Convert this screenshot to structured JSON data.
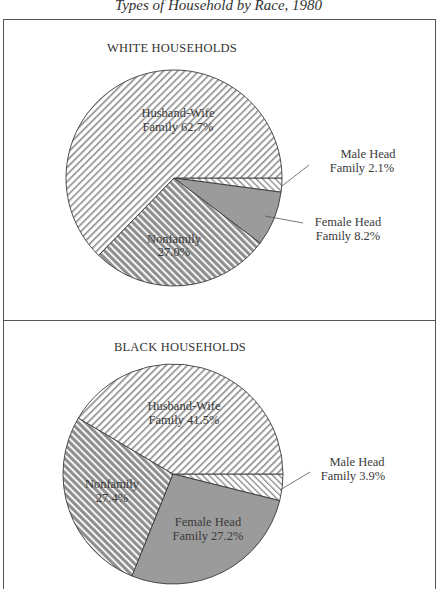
{
  "title": "Types of Household by Race, 1980",
  "chart_data": [
    {
      "type": "pie",
      "title": "WHITE HOUSEHOLDS",
      "categories": [
        "Husband-Wife Family",
        "Male Head Family",
        "Female Head Family",
        "Nonfamily"
      ],
      "values": [
        62.7,
        2.1,
        8.2,
        27.0
      ],
      "labels": [
        {
          "line1": "Husband-Wife",
          "line2": "Family 62.7%"
        },
        {
          "line1": "Male Head",
          "line2": "Family 2.1%"
        },
        {
          "line1": "Female Head",
          "line2": "Family 8.2%"
        },
        {
          "line1": "Nonfamily",
          "line2": "27.0%"
        }
      ],
      "legend": "none (inline labels with leader lines)"
    },
    {
      "type": "pie",
      "title": "BLACK HOUSEHOLDS",
      "categories": [
        "Husband-Wife Family",
        "Male Head Family",
        "Female Head Family",
        "Nonfamily"
      ],
      "values": [
        41.5,
        3.9,
        27.2,
        27.4
      ],
      "labels": [
        {
          "line1": "Husband-Wife",
          "line2": "Family 41.5%"
        },
        {
          "line1": "Male Head",
          "line2": "Family 3.9%"
        },
        {
          "line1": "Female Head",
          "line2": "Family 27.2%"
        },
        {
          "line1": "Nonfamily",
          "line2": "27.4%"
        }
      ],
      "legend": "none (inline labels with leader lines)"
    }
  ],
  "colors": {
    "husband_wife": "light diagonal hatch (\\)",
    "male_head": "fine diagonal hatch (/)",
    "female_head": "#9a9a9a",
    "nonfamily": "dark diagonal hatch (/)"
  }
}
